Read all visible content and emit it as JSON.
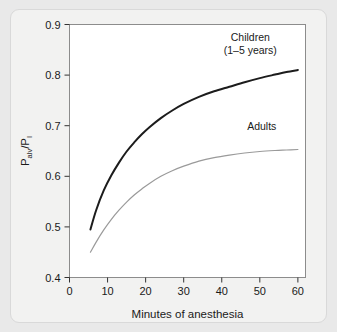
{
  "figure": {
    "background_color": "#e9e9e9",
    "card_color": "#f2f2f1",
    "plot_background_color": "#ffffff",
    "plot_border_color": "#8c8c8c"
  },
  "chart_data": {
    "type": "line",
    "title": "",
    "xlabel": "Minutes of anesthesia",
    "ylabel": "Palv/PI",
    "ylabel_parts": {
      "p1": "P",
      "sub1": "alv",
      "slash": "/",
      "p2": "P",
      "sub2": "I"
    },
    "xlim": [
      0,
      62
    ],
    "ylim": [
      0.4,
      0.9
    ],
    "xticks": [
      0,
      10,
      20,
      30,
      40,
      50,
      60
    ],
    "xtick_labels": [
      "0",
      "10",
      "20",
      "30",
      "40",
      "50",
      "60"
    ],
    "yticks": [
      0.4,
      0.5,
      0.6,
      0.7,
      0.8,
      0.9
    ],
    "ytick_labels": [
      "0.4",
      "0.5",
      "0.6",
      "0.7",
      "0.8",
      "0.9"
    ],
    "grid": false,
    "legend_position": "inline-annotations",
    "series": [
      {
        "name": "Children (1-5 years)",
        "label_line1": "Children",
        "label_line2": "(1–5 years)",
        "color": "#1c1c1c",
        "line_width": 2.0,
        "x": [
          5.5,
          7,
          9,
          11,
          13,
          15,
          17,
          19,
          21,
          24,
          27,
          30,
          34,
          38,
          42,
          46,
          50,
          54,
          57,
          60
        ],
        "y": [
          0.495,
          0.533,
          0.572,
          0.602,
          0.627,
          0.649,
          0.667,
          0.683,
          0.697,
          0.715,
          0.73,
          0.743,
          0.757,
          0.768,
          0.777,
          0.786,
          0.794,
          0.801,
          0.806,
          0.81
        ]
      },
      {
        "name": "Adults",
        "label_line1": "Adults",
        "label_line2": "",
        "color": "#9a9a9a",
        "line_width": 1.2,
        "x": [
          5.5,
          7,
          9,
          11,
          13,
          15,
          17,
          19,
          21,
          24,
          27,
          30,
          34,
          38,
          42,
          46,
          50,
          54,
          57,
          60
        ],
        "y": [
          0.45,
          0.47,
          0.494,
          0.515,
          0.533,
          0.549,
          0.563,
          0.575,
          0.586,
          0.6,
          0.611,
          0.62,
          0.63,
          0.637,
          0.642,
          0.646,
          0.649,
          0.651,
          0.652,
          0.653
        ]
      }
    ],
    "annotations": [
      {
        "text": "Children",
        "x": 47.5,
        "y": 0.876
      },
      {
        "text": "(1–5 years)",
        "x": 47.5,
        "y": 0.849
      },
      {
        "text": "Adults",
        "x": 50.5,
        "y": 0.699
      }
    ]
  }
}
